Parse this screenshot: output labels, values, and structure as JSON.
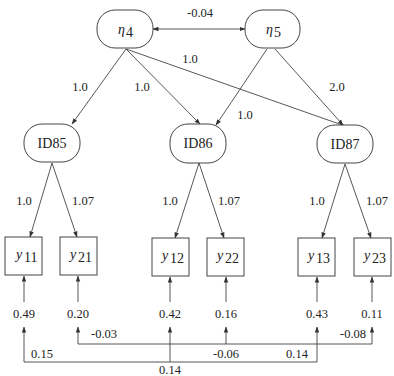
{
  "diagram": {
    "type": "path-diagram",
    "latent_factors": [
      {
        "id": "eta4",
        "label": "η",
        "sub": "4"
      },
      {
        "id": "eta5",
        "label": "η",
        "sub": "5"
      }
    ],
    "first_order_factors": [
      {
        "id": "ID85",
        "label": "ID85"
      },
      {
        "id": "ID86",
        "label": "ID86"
      },
      {
        "id": "ID87",
        "label": "ID87"
      }
    ],
    "indicators": [
      {
        "id": "y11",
        "label": "y",
        "sub": "11",
        "error_variance": "0.49"
      },
      {
        "id": "y21",
        "label": "y",
        "sub": "21",
        "error_variance": "0.20"
      },
      {
        "id": "y12",
        "label": "y",
        "sub": "12",
        "error_variance": "0.42"
      },
      {
        "id": "y22",
        "label": "y",
        "sub": "22",
        "error_variance": "0.16"
      },
      {
        "id": "y13",
        "label": "y",
        "sub": "13",
        "error_variance": "0.43"
      },
      {
        "id": "y23",
        "label": "y",
        "sub": "23",
        "error_variance": "0.11"
      }
    ],
    "factor_covariance": {
      "from": "eta4",
      "to": "eta5",
      "value": "-0.04"
    },
    "second_order_loadings": [
      {
        "from": "eta4",
        "to": "ID85",
        "value": "1.0"
      },
      {
        "from": "eta4",
        "to": "ID86",
        "value": "1.0"
      },
      {
        "from": "eta4",
        "to": "ID87",
        "value": "1.0"
      },
      {
        "from": "eta5",
        "to": "ID86",
        "value": "1.0"
      },
      {
        "from": "eta5",
        "to": "ID87",
        "value": "2.0"
      }
    ],
    "first_order_loadings": [
      {
        "from": "ID85",
        "to": "y11",
        "value": "1.0"
      },
      {
        "from": "ID85",
        "to": "y21",
        "value": "1.07"
      },
      {
        "from": "ID86",
        "to": "y12",
        "value": "1.0"
      },
      {
        "from": "ID86",
        "to": "y22",
        "value": "1.07"
      },
      {
        "from": "ID87",
        "to": "y13",
        "value": "1.0"
      },
      {
        "from": "ID87",
        "to": "y23",
        "value": "1.07"
      }
    ],
    "error_covariances": [
      {
        "between": [
          "y21",
          "y22"
        ],
        "value": "-0.03"
      },
      {
        "between": [
          "y22",
          "y23"
        ],
        "value": "-0.06"
      },
      {
        "between": [
          "y21",
          "y23"
        ],
        "value": "-0.08"
      },
      {
        "between": [
          "y11",
          "y12"
        ],
        "value": "0.15"
      },
      {
        "between": [
          "y12",
          "y13"
        ],
        "value": "0.14"
      },
      {
        "between": [
          "y11",
          "y13"
        ],
        "value": "0.14"
      }
    ]
  }
}
